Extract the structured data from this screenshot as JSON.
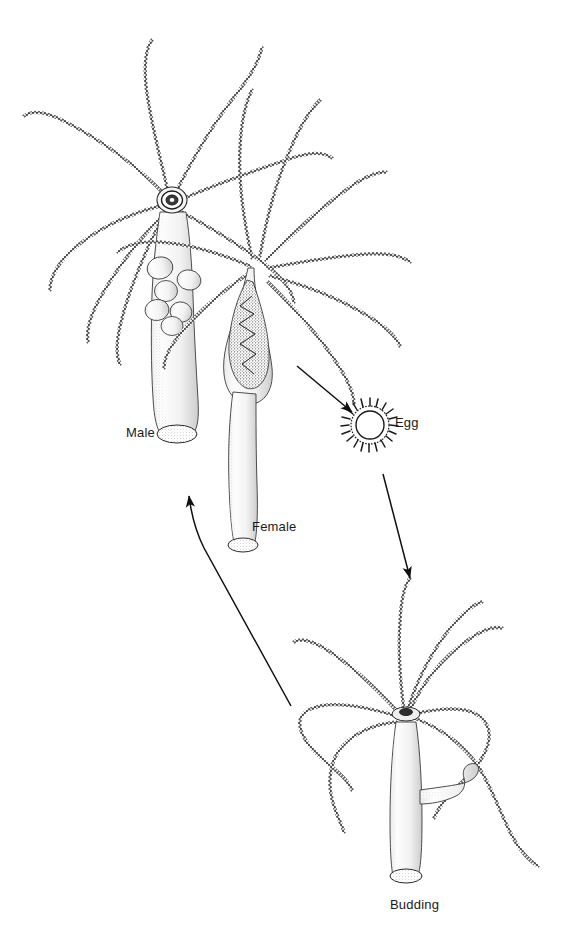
{
  "figure": {
    "kind": "scientific-line-drawing",
    "background_color": "#ffffff",
    "ink_color": "#1a1a1a",
    "width": 574,
    "height": 933
  },
  "labels": {
    "male": "Male",
    "female": "Female",
    "egg": "Egg",
    "budding": "Budding"
  },
  "label_positions": {
    "male": {
      "x": 126,
      "y": 425
    },
    "female": {
      "x": 252,
      "y": 519
    },
    "egg": {
      "x": 395,
      "y": 415
    },
    "budding": {
      "x": 390,
      "y": 897
    }
  },
  "organisms": [
    {
      "name": "male-hydra",
      "label": "Male",
      "feature": "testes-bulges-on-column",
      "tentacle_count": 7,
      "column": {
        "top_x": 172,
        "top_y": 200,
        "base_x": 178,
        "base_y": 437
      }
    },
    {
      "name": "female-hydra",
      "label": "Female",
      "feature": "swollen-ovary-with-developing-egg",
      "tentacle_count": 8,
      "column": {
        "top_x": 258,
        "top_y": 262,
        "base_x": 243,
        "base_y": 549
      }
    },
    {
      "name": "egg-capsule",
      "label": "Egg",
      "feature": "spiny-theca-ring",
      "center": {
        "x": 370,
        "y": 422
      },
      "radius": 16
    },
    {
      "name": "budding-hydra",
      "label": "Budding",
      "feature": "lateral-bud-on-column",
      "tentacle_count": 8,
      "column": {
        "top_x": 405,
        "top_y": 712,
        "base_x": 410,
        "base_y": 880
      }
    }
  ],
  "arrows": [
    {
      "name": "arrow-female-to-egg",
      "from": "female-hydra",
      "to": "egg-capsule",
      "start": {
        "x": 296,
        "y": 365
      },
      "end": {
        "x": 356,
        "y": 415
      }
    },
    {
      "name": "arrow-egg-to-budding",
      "from": "egg-capsule",
      "to": "budding-hydra",
      "start": {
        "x": 383,
        "y": 475
      },
      "end": {
        "x": 412,
        "y": 582
      }
    },
    {
      "name": "arrow-budding-to-adults",
      "from": "budding-hydra",
      "to": "male-hydra",
      "start": {
        "x": 290,
        "y": 707
      },
      "end": {
        "x": 187,
        "y": 491
      }
    }
  ]
}
